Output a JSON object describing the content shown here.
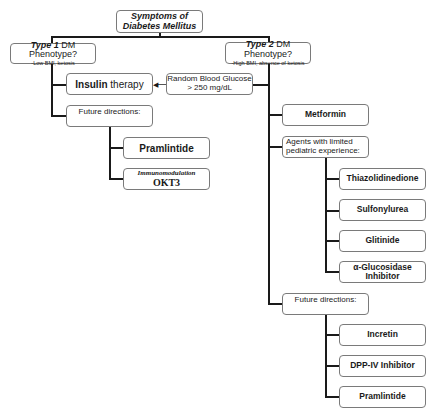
{
  "root": {
    "line1": "Symptoms of",
    "line2": "Diabetes Mellitus"
  },
  "type1": {
    "title_bold": "Type 1",
    "title_rest": " DM Phenotype?",
    "subtitle": "-Low BMI, ketosis",
    "insulin": {
      "bold": "Insulin",
      "rest": " therapy"
    },
    "future_label": "Future directions:",
    "future_items": [
      {
        "label": "Pramlintide"
      },
      {
        "italic": "Immunomodulation",
        "label": "OKT3"
      }
    ]
  },
  "type2": {
    "title_bold": "Type 2",
    "title_rest": " DM Phenotype?",
    "subtitle": "-High BMI, absence of ketosis",
    "glucose": {
      "line1": "Random Blood Glucose",
      "line2": "> 250 mg/dL"
    },
    "metformin": "Metformin",
    "agents_label": {
      "line1": "Agents with limited",
      "line2": "pediatric experience:"
    },
    "agents": [
      {
        "label": "Thiazolidinedione"
      },
      {
        "label": "Sulfonylurea"
      },
      {
        "label": "Glitinide"
      },
      {
        "line1": "α-Glucosidase",
        "line2": "Inhibitor"
      }
    ],
    "future_label": "Future directions:",
    "future_items": [
      {
        "label": "Incretin"
      },
      {
        "label": "DPP-IV Inhibitor"
      },
      {
        "label": "Pramlintide"
      }
    ]
  },
  "colors": {
    "line": "#1a1a1a",
    "box_border": "#7a7a7a"
  }
}
